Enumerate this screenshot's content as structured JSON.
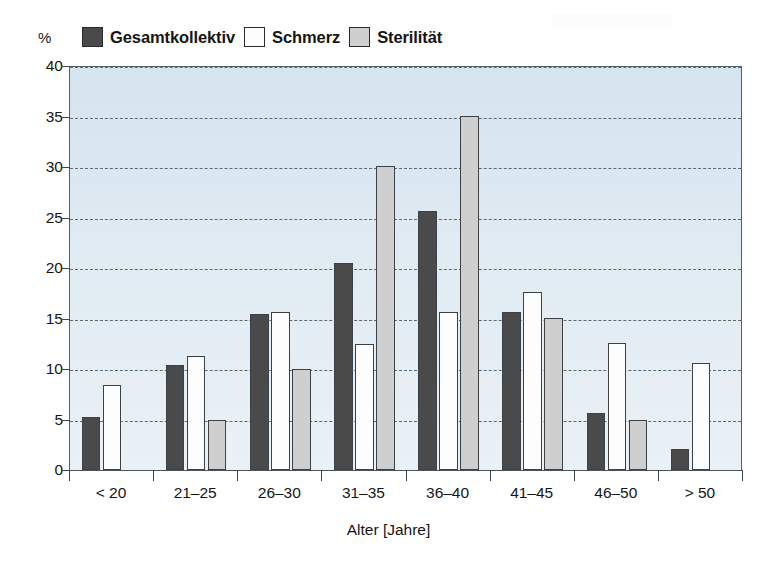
{
  "chart_data": {
    "type": "bar",
    "title": "",
    "xlabel": "Alter [Jahre]",
    "ylabel": "%",
    "ylim": [
      0,
      40
    ],
    "yticks": [
      0,
      5,
      10,
      15,
      20,
      25,
      30,
      35,
      40
    ],
    "grid": true,
    "legend_position": "top-left",
    "categories": [
      "< 20",
      "21–25",
      "26–30",
      "31–35",
      "36–40",
      "41–45",
      "46–50",
      "> 50"
    ],
    "series": [
      {
        "name": "Gesamtkollektiv",
        "color": "#4a4a4a",
        "values": [
          5.2,
          10.4,
          15.4,
          20.5,
          25.6,
          15.6,
          5.6,
          2.1
        ]
      },
      {
        "name": "Schmerz",
        "color": "#fdfdfd",
        "values": [
          8.4,
          11.3,
          15.6,
          12.5,
          15.6,
          17.6,
          12.6,
          10.6
        ]
      },
      {
        "name": "Sterilität",
        "color": "#cfcfcf",
        "values": [
          null,
          5.0,
          10.0,
          30.1,
          35.1,
          15.1,
          5.0,
          null
        ]
      }
    ],
    "colors": {
      "plot_background": "#e0ebf3",
      "gridline": "#5a6a76",
      "axis": "#4a545c",
      "bar_outline": "#3a4248"
    }
  },
  "legend": {
    "entries": [
      {
        "label": "Gesamtkollektiv",
        "color": "#4a4a4a"
      },
      {
        "label": "Schmerz",
        "color": "#fdfdfd"
      },
      {
        "label": "Sterilität",
        "color": "#cfcfcf"
      }
    ]
  },
  "axes": {
    "y_unit": "%",
    "y_tick_labels": [
      "40",
      "35",
      "30",
      "25",
      "20",
      "15",
      "10",
      "5",
      "0"
    ],
    "x_tick_labels": [
      "< 20",
      "21–25",
      "26–30",
      "31–35",
      "36–40",
      "41–45",
      "46–50",
      "> 50"
    ],
    "x_axis_title": "Alter [Jahre]"
  }
}
